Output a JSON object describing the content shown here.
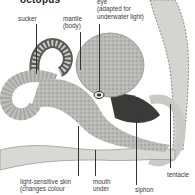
{
  "diagram": {
    "title": "octopus",
    "labels": {
      "sucker": "sucker",
      "mantle": "mantle\n(body)",
      "eye": "eye\n(adapted for\nunderwater light)",
      "skin": "light-sensitive skin\n(changes colour",
      "mouth": "mouth\nunder",
      "siphon": "siphon",
      "tentacle": "tentacle"
    },
    "colors": {
      "background": "#ffffff",
      "body_light": "#d9d9d6",
      "body_mid": "#a8a8a4",
      "body_dark": "#3a3a38",
      "text": "#3a3a3a",
      "leader": "#333333"
    }
  }
}
